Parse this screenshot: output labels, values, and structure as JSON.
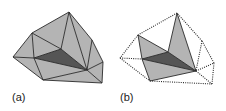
{
  "figure": {
    "colors": {
      "light_fill": "#b4b4b4",
      "dark_fill": "#555555",
      "edge": "#2a2a2a",
      "background": "#ffffff"
    },
    "panels": [
      {
        "id": "a",
        "label": "(a)",
        "label_pos": [
          12,
          103
        ],
        "vertices": {
          "top": [
            69,
            12
          ],
          "left_upper": [
            32,
            33
          ],
          "far_left": [
            13,
            57
          ],
          "inner": [
            61,
            49
          ],
          "left_mid": [
            34,
            58
          ],
          "bri": [
            87,
            70
          ],
          "right_upper": [
            92,
            40
          ],
          "far_right": [
            103,
            62
          ],
          "bottom_right": [
            102,
            83
          ],
          "bottom_left": [
            43,
            80
          ]
        },
        "light_triangles": [
          [
            "top",
            "left_upper",
            "inner"
          ],
          [
            "left_upper",
            "inner",
            "left_mid"
          ],
          [
            "left_upper",
            "far_left",
            "left_mid"
          ],
          [
            "far_left",
            "left_mid",
            "bottom_left"
          ],
          [
            "left_mid",
            "bri",
            "bottom_left"
          ],
          [
            "bottom_left",
            "bri",
            "bottom_right"
          ],
          [
            "bri",
            "far_right",
            "bottom_right"
          ],
          [
            "bri",
            "right_upper",
            "far_right"
          ],
          [
            "top",
            "right_upper",
            "bri"
          ],
          [
            "top",
            "inner",
            "bri"
          ]
        ],
        "dark_triangles": [
          [
            "inner",
            "left_mid",
            "bri"
          ]
        ],
        "solid_edges": [
          [
            "top",
            "left_upper"
          ],
          [
            "left_upper",
            "far_left"
          ],
          [
            "far_left",
            "bottom_left"
          ],
          [
            "bottom_left",
            "bottom_right"
          ],
          [
            "bottom_right",
            "far_right"
          ],
          [
            "far_right",
            "right_upper"
          ],
          [
            "right_upper",
            "top"
          ],
          [
            "left_upper",
            "inner"
          ],
          [
            "left_upper",
            "left_mid"
          ],
          [
            "top",
            "inner"
          ],
          [
            "top",
            "bri"
          ],
          [
            "far_left",
            "left_mid"
          ],
          [
            "left_mid",
            "inner"
          ],
          [
            "inner",
            "bri"
          ],
          [
            "left_mid",
            "bri"
          ],
          [
            "left_mid",
            "bottom_left"
          ],
          [
            "bottom_left",
            "bri"
          ],
          [
            "bri",
            "far_right"
          ],
          [
            "bri",
            "bottom_right"
          ],
          [
            "right_upper",
            "bri"
          ]
        ],
        "dotted_edges": []
      },
      {
        "id": "b",
        "label": "(b)",
        "label_pos": [
          120,
          103
        ],
        "vertices": {
          "top": [
            177,
            13
          ],
          "left_upper": [
            138,
            35
          ],
          "far_left": [
            120,
            58
          ],
          "inner": [
            168,
            52
          ],
          "left_mid": [
            142,
            59
          ],
          "bri": [
            196,
            71
          ],
          "right_upper": [
            202,
            41
          ],
          "far_right": [
            214,
            63
          ],
          "bottom_right": [
            212,
            84
          ],
          "bottom_left": [
            150,
            81
          ]
        },
        "light_triangles": [
          [
            "left_upper",
            "inner",
            "left_mid"
          ],
          [
            "top",
            "inner",
            "bri"
          ],
          [
            "left_mid",
            "bri",
            "bottom_left"
          ]
        ],
        "dark_triangles": [
          [
            "inner",
            "left_mid",
            "bri"
          ]
        ],
        "solid_edges": [
          [
            "left_upper",
            "inner"
          ],
          [
            "left_upper",
            "left_mid"
          ],
          [
            "top",
            "inner"
          ],
          [
            "top",
            "bri"
          ],
          [
            "left_mid",
            "inner"
          ],
          [
            "inner",
            "bri"
          ],
          [
            "left_mid",
            "bri"
          ],
          [
            "left_mid",
            "bottom_left"
          ],
          [
            "bottom_left",
            "bri"
          ]
        ],
        "dotted_edges": [
          [
            "top",
            "left_upper"
          ],
          [
            "left_upper",
            "far_left"
          ],
          [
            "far_left",
            "bottom_left"
          ],
          [
            "bottom_left",
            "bottom_right"
          ],
          [
            "bottom_right",
            "far_right"
          ],
          [
            "far_right",
            "right_upper"
          ],
          [
            "right_upper",
            "top"
          ],
          [
            "far_left",
            "left_mid"
          ],
          [
            "bri",
            "far_right"
          ],
          [
            "bri",
            "bottom_right"
          ],
          [
            "right_upper",
            "bri"
          ]
        ]
      }
    ]
  }
}
